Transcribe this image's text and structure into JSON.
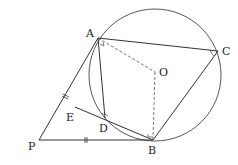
{
  "diagram": {
    "type": "geometry",
    "colors": {
      "line": "#333333",
      "dashed": "#555555",
      "background": "#ffffff"
    },
    "circle": {
      "center": "O",
      "cx": 155,
      "cy": 75,
      "r": 66
    },
    "points": {
      "A": {
        "label": "A",
        "x": 98,
        "y": 38,
        "lx": 86,
        "ly": 37
      },
      "C": {
        "label": "C",
        "x": 218,
        "y": 51,
        "lx": 222,
        "ly": 55
      },
      "O": {
        "label": "O",
        "x": 155,
        "y": 72,
        "lx": 159,
        "ly": 76
      },
      "B": {
        "label": "B",
        "x": 153,
        "y": 140,
        "lx": 148,
        "ly": 154
      },
      "D": {
        "label": "D",
        "x": 105,
        "y": 118,
        "lx": 99,
        "ly": 132
      },
      "E": {
        "label": "E",
        "x": 75,
        "y": 107,
        "lx": 66,
        "ly": 121
      },
      "P": {
        "label": "P",
        "x": 39,
        "y": 140,
        "lx": 28,
        "ly": 150
      }
    },
    "segments": [
      {
        "from": "P",
        "to": "A",
        "style": "solid",
        "tick": "double"
      },
      {
        "from": "P",
        "to": "B",
        "style": "solid",
        "tick": "double"
      },
      {
        "from": "A",
        "to": "C",
        "style": "solid"
      },
      {
        "from": "C",
        "to": "B",
        "style": "solid"
      },
      {
        "from": "A",
        "to": "D",
        "style": "solid"
      },
      {
        "from": "E",
        "to": "B",
        "style": "solid"
      },
      {
        "from": "A",
        "to": "O",
        "style": "dashed"
      },
      {
        "from": "O",
        "to": "B",
        "style": "dashed"
      }
    ],
    "angle_marks": [
      "A (right angle)",
      "C",
      "D",
      "B (right angle)"
    ]
  }
}
